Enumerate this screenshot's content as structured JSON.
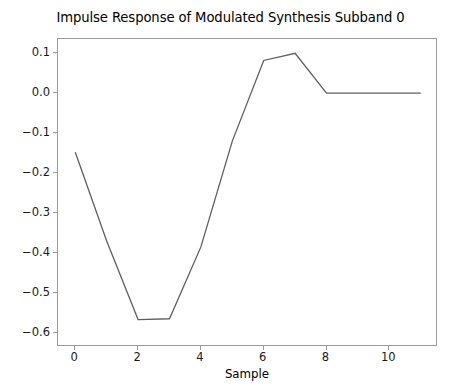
{
  "chart_data": {
    "type": "line",
    "title": "Impulse Response of Modulated Synthesis Subband 0",
    "xlabel": "Sample",
    "ylabel": "",
    "x": [
      0,
      1,
      2,
      3,
      4,
      5,
      6,
      7,
      8,
      9,
      10,
      11
    ],
    "values": [
      -0.148,
      -0.37,
      -0.567,
      -0.565,
      -0.385,
      -0.12,
      0.082,
      0.1,
      0.0,
      0.0,
      0.0,
      0.0
    ],
    "series": [
      {
        "name": "Impulse Response",
        "values": [
          -0.148,
          -0.37,
          -0.567,
          -0.565,
          -0.385,
          -0.12,
          0.082,
          0.1,
          0.0,
          0.0,
          0.0,
          0.0
        ]
      }
    ],
    "xlim": [
      -0.55,
      11.55
    ],
    "ylim": [
      -0.6357,
      0.1357
    ],
    "xticks": [
      0,
      2,
      4,
      6,
      8,
      10
    ],
    "xticklabels": [
      "0",
      "2",
      "4",
      "6",
      "8",
      "10"
    ],
    "yticks": [
      0.1,
      0.0,
      -0.1,
      -0.2,
      -0.3,
      -0.4,
      -0.5,
      -0.6
    ],
    "yticklabels": [
      "0.1",
      "0.0",
      "−0.1",
      "−0.2",
      "−0.3",
      "−0.4",
      "−0.5",
      "−0.6"
    ],
    "grid": false,
    "legend": null,
    "line_color": "#5f5f5f",
    "line_width": 1.3,
    "spine_color": "#9a9a9a",
    "background_color": "#ffffff"
  }
}
